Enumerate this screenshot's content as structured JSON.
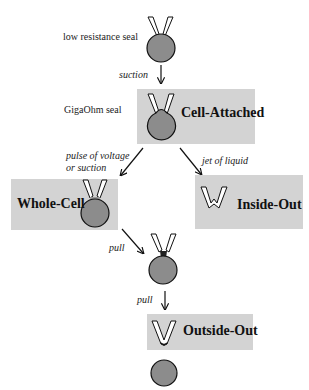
{
  "diagram": {
    "colors": {
      "box_fill": "#d3d3d3",
      "cell_fill": "#8c8c8c",
      "pipette_fill": "#ffffff",
      "outline": "#111111"
    },
    "stages": {
      "low_resistance": {
        "label": "low resistance seal"
      },
      "gigaohm": {
        "label": "GigaOhm seal"
      },
      "cell_attached": {
        "title": "Cell-Attached"
      },
      "whole_cell": {
        "title": "Whole-Cell"
      },
      "inside_out": {
        "title": "Inside-Out"
      },
      "outside_out": {
        "title": "Outside-Out"
      }
    },
    "transitions": {
      "suction": "suction",
      "pulse_line1": "pulse of voltage",
      "pulse_line2": "or suction",
      "jet": "jet of liquid",
      "pull1": "pull",
      "pull2": "pull"
    }
  }
}
